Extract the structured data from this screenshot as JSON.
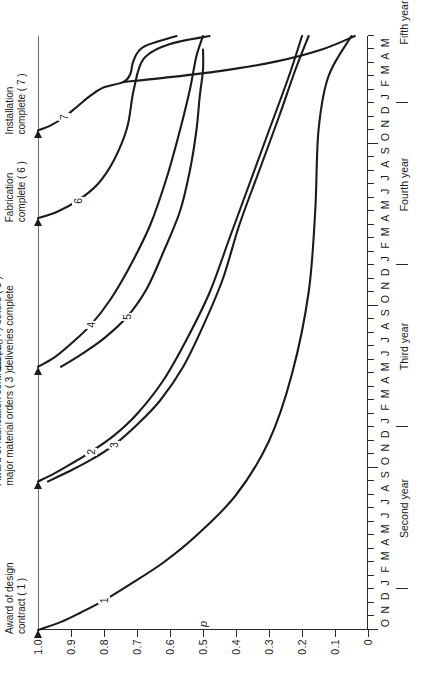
{
  "figure": {
    "orientation": "rotated-90-ccw",
    "p_axis_title": "p",
    "p_ticks": [
      "1.0",
      "0.9",
      "0.8",
      "0.7",
      "0.6",
      "0.5",
      "0.4",
      "0.3",
      "0.2",
      "0.1",
      "0"
    ],
    "p_values": [
      1.0,
      0.9,
      0.8,
      0.7,
      0.6,
      0.5,
      0.4,
      0.3,
      0.2,
      0.1,
      0.0
    ],
    "months": [
      "O",
      "N",
      "D",
      "J",
      "F",
      "M",
      "A",
      "M",
      "J",
      "J",
      "A",
      "S",
      "O",
      "N",
      "D",
      "J",
      "F",
      "M",
      "A",
      "M",
      "J",
      "J",
      "A",
      "S",
      "O",
      "N",
      "D",
      "J",
      "F",
      "M",
      "A",
      "M",
      "J",
      "J",
      "A",
      "S",
      "O",
      "N",
      "D",
      "J",
      "F",
      "M",
      "A",
      "M"
    ],
    "year_labels": [
      "Second year",
      "Third year",
      "Fourth year",
      "Fifth year"
    ],
    "milestones": [
      {
        "id": 1,
        "text": "Award of design\ncontract ( 1 )"
      },
      {
        "id": 3,
        "text": "Award of fabrication contract ( 2 )\nmajor material orders ( 3 )"
      },
      {
        "id": 5,
        "text": "Steel ( 4 ) others ( 5 )\ndeliveries complete"
      },
      {
        "id": 6,
        "text": "Fabrication\ncomplete ( 6 )"
      },
      {
        "id": 7,
        "text": "Installation\ncomplete ( 7 )"
      }
    ],
    "curve_labels": [
      "1",
      "2",
      "3",
      "4",
      "5",
      "6",
      "7"
    ]
  },
  "chart_data": {
    "type": "line",
    "title": "",
    "xlabel": "",
    "ylabel": "p",
    "ylim": [
      0,
      1.0
    ],
    "xlim": [
      0,
      44
    ],
    "grid": false,
    "legend": "inline-curve-numbers",
    "x_tick_labels": [
      "O",
      "N",
      "D",
      "J",
      "F",
      "M",
      "A",
      "M",
      "J",
      "J",
      "A",
      "S",
      "O",
      "N",
      "D",
      "J",
      "F",
      "M",
      "A",
      "M",
      "J",
      "J",
      "A",
      "S",
      "O",
      "N",
      "D",
      "J",
      "F",
      "M",
      "A",
      "M",
      "J",
      "J",
      "A",
      "S",
      "O",
      "N",
      "D",
      "J",
      "F",
      "M",
      "A",
      "M"
    ],
    "x_group_labels": [
      "Second year",
      "Third year",
      "Fourth year",
      "Fifth year"
    ],
    "y_tick_labels": [
      "1.0",
      "0.9",
      "0.8",
      "0.7",
      "0.6",
      "0.5",
      "0.4",
      "0.3",
      "0.2",
      "0.1",
      "0"
    ],
    "series": [
      {
        "name": "1",
        "label": "1",
        "milestone": "Award of design contract ( 1 )",
        "x": [
          0.0,
          0.6,
          1.3,
          2.2,
          3.4,
          5.0,
          7.0,
          10.0,
          14.0,
          19.0,
          25.0,
          31.0,
          37.0,
          41.0,
          44.0
        ],
        "y": [
          1.0,
          0.93,
          0.87,
          0.8,
          0.72,
          0.62,
          0.52,
          0.4,
          0.3,
          0.23,
          0.18,
          0.16,
          0.15,
          0.12,
          0.05
        ]
      },
      {
        "name": "2",
        "label": "2",
        "milestone": "Award of fabrication contract ( 2 )",
        "x": [
          11.0,
          11.6,
          12.3,
          13.2,
          14.4,
          16.0,
          18.5,
          21.5,
          25.0,
          29.0,
          33.0,
          37.0,
          41.0,
          44.0
        ],
        "y": [
          1.0,
          0.95,
          0.9,
          0.84,
          0.77,
          0.7,
          0.62,
          0.55,
          0.48,
          0.42,
          0.36,
          0.3,
          0.24,
          0.2
        ]
      },
      {
        "name": "3",
        "label": "3",
        "milestone": "Major material orders ( 3 )",
        "x": [
          11.0,
          11.7,
          12.6,
          13.7,
          15.2,
          17.0,
          19.5,
          22.5,
          26.0,
          30.0,
          34.0,
          38.0,
          41.5,
          44.0
        ],
        "y": [
          0.97,
          0.91,
          0.84,
          0.77,
          0.7,
          0.63,
          0.56,
          0.5,
          0.44,
          0.39,
          0.33,
          0.27,
          0.22,
          0.18
        ]
      },
      {
        "name": "4",
        "label": "4",
        "milestone": "Steel ( 4 ) deliveries complete",
        "x": [
          19.5,
          20.2,
          21.2,
          22.6,
          24.5,
          27.0,
          30.0,
          33.5,
          37.0,
          40.0,
          42.5,
          44.0
        ],
        "y": [
          1.0,
          0.95,
          0.9,
          0.84,
          0.78,
          0.72,
          0.66,
          0.61,
          0.57,
          0.54,
          0.52,
          0.5
        ]
      },
      {
        "name": "5",
        "label": "5",
        "milestone": "Others ( 5 ) deliveries complete",
        "x": [
          19.5,
          20.4,
          21.6,
          23.2,
          25.3,
          28.0,
          31.0,
          34.0,
          37.0,
          39.5,
          41.5,
          43.0
        ],
        "y": [
          0.93,
          0.87,
          0.8,
          0.73,
          0.67,
          0.62,
          0.57,
          0.54,
          0.52,
          0.51,
          0.5,
          0.5
        ]
      },
      {
        "name": "6",
        "label": "6",
        "milestone": "Fabrication complete ( 6 )",
        "x": [
          30.5,
          31.0,
          31.8,
          33.0,
          34.8,
          37.2,
          40.0,
          42.3,
          43.4,
          44.0
        ],
        "y": [
          1.0,
          0.94,
          0.88,
          0.82,
          0.77,
          0.73,
          0.71,
          0.68,
          0.6,
          0.48
        ]
      },
      {
        "name": "7",
        "label": "7",
        "milestone": "Installation complete ( 7 )",
        "x": [
          37.0,
          37.4,
          38.0,
          38.8,
          39.6,
          40.2,
          40.6,
          41.2,
          42.2,
          43.2,
          44.0
        ],
        "y": [
          1.0,
          0.96,
          0.92,
          0.88,
          0.84,
          0.8,
          0.74,
          0.72,
          0.71,
          0.68,
          0.58
        ]
      },
      {
        "name": "7b",
        "label": "",
        "milestone": "Installation complete ( 7 ) upper branch",
        "x": [
          40.6,
          40.9,
          41.4,
          42.1,
          43.0,
          44.0
        ],
        "y": [
          0.74,
          0.62,
          0.45,
          0.28,
          0.14,
          0.04
        ]
      }
    ],
    "milestone_markers": [
      {
        "label": "Award of design contract ( 1 )",
        "x": 0.0,
        "p": 1.0
      },
      {
        "label": "Award of fabrication contract ( 2 ) major material orders ( 3 )",
        "x": 11.0,
        "p": 1.0
      },
      {
        "label": "Steel ( 4 ) others ( 5 ) deliveries complete",
        "x": 19.5,
        "p": 1.0
      },
      {
        "label": "Fabrication complete ( 6 )",
        "x": 30.5,
        "p": 1.0
      },
      {
        "label": "Installation complete ( 7 )",
        "x": 37.0,
        "p": 1.0
      }
    ]
  }
}
